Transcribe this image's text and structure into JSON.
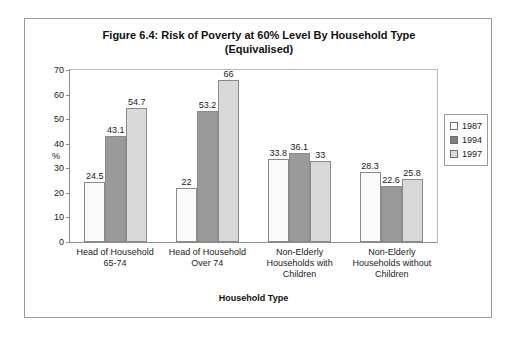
{
  "chart_data": {
    "type": "bar",
    "title": "Figure 6.4: Risk of Poverty at 60% Level By Household Type (Equivalised)",
    "title_line1": "Figure 6.4: Risk of Poverty at 60% Level By Household Type",
    "title_line2": "(Equivalised)",
    "xlabel": "Household Type",
    "ylabel": "%",
    "ylim": [
      0,
      70
    ],
    "ytick_step": 10,
    "yticks": [
      70,
      60,
      50,
      40,
      30,
      20,
      10,
      0
    ],
    "grid": false,
    "legend_position": "right",
    "categories": [
      "Head of Household 65-74",
      "Head of Household Over 74",
      "Non-Elderly Households with Children",
      "Non-Elderly Households without Children"
    ],
    "category_lines": [
      [
        "Head of Household",
        "65-74"
      ],
      [
        "Head of Household",
        "Over 74"
      ],
      [
        "Non-Elderly",
        "Households with",
        "Children"
      ],
      [
        "Non-Elderly",
        "Households without",
        "Children"
      ]
    ],
    "series": [
      {
        "name": "1987",
        "color": "#ffffff",
        "values": [
          24.5,
          22,
          33.8,
          28.3
        ],
        "labels": [
          "24.5",
          "22",
          "33.8",
          "28.3"
        ]
      },
      {
        "name": "1994",
        "color": "#808080",
        "values": [
          43.1,
          53.2,
          36.1,
          22.6
        ],
        "labels": [
          "43.1",
          "53.2",
          "36.1",
          "22.6"
        ]
      },
      {
        "name": "1997",
        "color": "#d9d9d9",
        "values": [
          54.7,
          66,
          33,
          25.8
        ],
        "labels": [
          "54.7",
          "66",
          "33",
          "25.8"
        ]
      }
    ]
  },
  "legend": {
    "entries": [
      "1987",
      "1994",
      "1997"
    ]
  }
}
